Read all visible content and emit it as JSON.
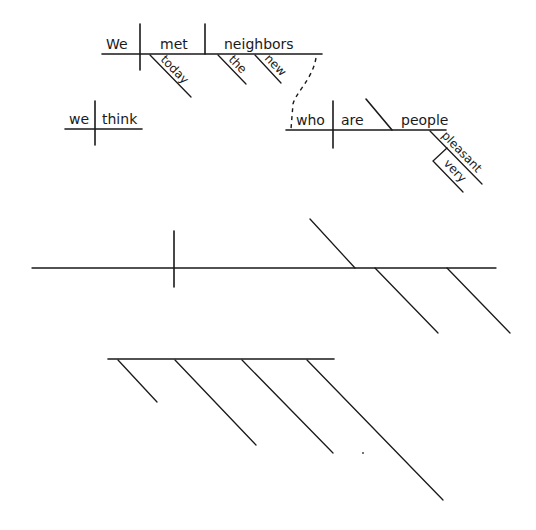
{
  "diagram": {
    "type": "sentence-diagram",
    "main_clause": {
      "subject": "We",
      "verb": "met",
      "object": "neighbors",
      "verb_modifiers": [
        "today"
      ],
      "object_modifiers": [
        "the",
        "new"
      ]
    },
    "relative_clause": {
      "subject": "who",
      "verb": "are",
      "predicate_nominative": "people",
      "predicate_modifiers": [
        "pleasant"
      ],
      "adverb_of_modifier": "very"
    },
    "parenthetical_clause": {
      "subject": "we",
      "verb": "think"
    },
    "blank_diagrams": [
      {
        "description": "empty baseline with subject divider, predicate slash and two modifier slashes"
      },
      {
        "description": "empty baseline with four descending modifier slashes"
      }
    ]
  }
}
